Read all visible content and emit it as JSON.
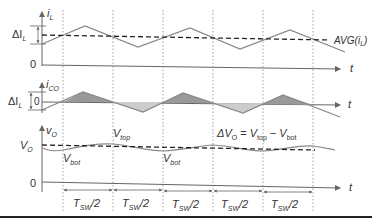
{
  "diagram": {
    "type": "buck-converter-ripple-waveforms",
    "panels": [
      {
        "id": "inductor-current",
        "y_label": "i_L",
        "y_label_sym": "i",
        "y_label_sub": "L",
        "delta_label": "ΔI",
        "delta_sub": "L",
        "avg_label": "AVG(i",
        "avg_sub": "L",
        "avg_close": ")",
        "zero_label": "0",
        "t_label": "t"
      },
      {
        "id": "capacitor-current",
        "y_label_sym": "i",
        "y_label_sub": "CO",
        "delta_label": "ΔI",
        "delta_sub": "L",
        "zero_label": "0",
        "t_label": "t"
      },
      {
        "id": "output-voltage",
        "y_label_sym": "v",
        "y_label_sub": "O",
        "level_sym": "V",
        "level_sub": "O",
        "vtop_sym": "V",
        "vtop_sub": "top",
        "vbot_sym": "V",
        "vbot_sub": "bot",
        "equation": {
          "lhs": "ΔV",
          "lhs_sub": "O",
          "eq": " = ",
          "a": "V",
          "a_sub": "top",
          "minus": " − ",
          "b": "V",
          "b_sub": "bot"
        },
        "zero_label": "0",
        "t_label": "t"
      }
    ],
    "intervals": [
      {
        "sym": "T",
        "sub": "SW",
        "tail": "/2"
      },
      {
        "sym": "T",
        "sub": "SW",
        "tail": "/2"
      },
      {
        "sym": "T",
        "sub": "SW",
        "tail": "/2"
      },
      {
        "sym": "T",
        "sub": "SW",
        "tail": "/2"
      },
      {
        "sym": "T",
        "sub": "SW",
        "tail": "/2"
      }
    ]
  }
}
